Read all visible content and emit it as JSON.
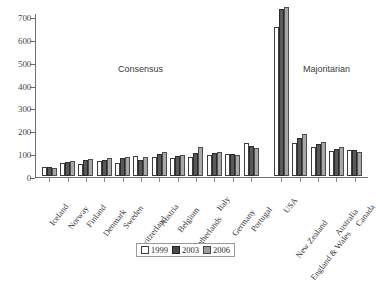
{
  "chart_data": {
    "type": "bar",
    "title": "",
    "xlabel": "",
    "ylabel": "",
    "ylim": [
      0,
      700
    ],
    "yticks": [
      0,
      100,
      200,
      300,
      400,
      500,
      600,
      700
    ],
    "grid": false,
    "legend_position": "bottom-center",
    "categories": [
      "Iceland",
      "Norway",
      "Finland",
      "Denmark",
      "Sweden",
      "Switzerland",
      "Austria",
      "Belgium",
      "Netherlands",
      "Italy",
      "Germany",
      "Portugal",
      "USA",
      "New Zealand",
      "England & Wales",
      "Australia",
      "Canada"
    ],
    "series": [
      {
        "name": "1999",
        "color": "#ffffff",
        "values": [
          40,
          55,
          51,
          64,
          58,
          88,
          85,
          78,
          83,
          90,
          95,
          145,
          650,
          145,
          125,
          110,
          115
        ]
      },
      {
        "name": "2003",
        "color": "#595959",
        "values": [
          38,
          62,
          71,
          71,
          79,
          71,
          98,
          88,
          99,
          100,
          96,
          131,
          730,
          165,
          140,
          117,
          116
        ]
      },
      {
        "name": "2006",
        "color": "#a8a8a8",
        "values": [
          36,
          65,
          75,
          77,
          82,
          83,
          105,
          91,
          128,
          104,
          94,
          121,
          738,
          186,
          148,
          126,
          107
        ]
      }
    ],
    "annotations": [
      {
        "text": "Consensus",
        "group": "left"
      },
      {
        "text": "Majoritarian",
        "group": "right"
      }
    ],
    "group_split_after_index": 11
  },
  "legend": {
    "items": [
      {
        "label": "1999"
      },
      {
        "label": "2003"
      },
      {
        "label": "2006"
      }
    ]
  },
  "annotations": {
    "consensus": "Consensus",
    "majoritarian": "Majoritarian"
  }
}
